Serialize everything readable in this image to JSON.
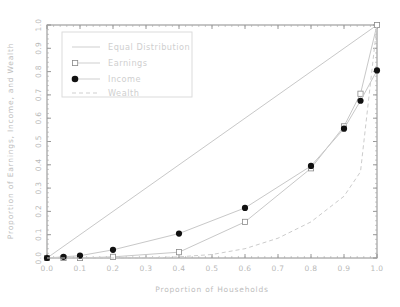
{
  "chart_data": {
    "type": "line",
    "title": "",
    "xlabel": "Proportion of Households",
    "ylabel": "Proportion of Earnings, Income, and Wealth",
    "xlim": [
      0.0,
      1.0
    ],
    "ylim": [
      0.0,
      1.0
    ],
    "grid": false,
    "legend_position": "upper left",
    "xticks": [
      "0.0",
      "0.1",
      "0.2",
      "0.3",
      "0.4",
      "0.5",
      "0.6",
      "0.7",
      "0.8",
      "0.9",
      "1.0"
    ],
    "xtick_values": [
      0.0,
      0.1,
      0.2,
      0.3,
      0.4,
      0.5,
      0.6,
      0.7,
      0.8,
      0.9,
      1.0
    ],
    "yticks": [
      "0.0",
      "0.1",
      "0.2",
      "0.3",
      "0.4",
      "0.5",
      "0.6",
      "0.7",
      "0.8",
      "0.9",
      "1.0"
    ],
    "ytick_values": [
      0.0,
      0.1,
      0.2,
      0.3,
      0.4,
      0.5,
      0.6,
      0.7,
      0.8,
      0.9,
      1.0
    ],
    "series": [
      {
        "name": "Equal Distribution",
        "style": "solid",
        "marker": "none",
        "color": "#c8c8c8",
        "x": [
          0.0,
          1.0
        ],
        "values": [
          0.0,
          1.0
        ]
      },
      {
        "name": "Earnings",
        "style": "solid",
        "marker": "square",
        "color": "#c8c8c8",
        "marker_color": "#ffffff",
        "marker_edge": "#8a8a8a",
        "x": [
          0.0,
          0.05,
          0.1,
          0.2,
          0.4,
          0.6,
          0.8,
          0.9,
          0.95,
          1.0
        ],
        "values": [
          0.0,
          0.0,
          0.0,
          0.005,
          0.025,
          0.155,
          0.385,
          0.565,
          0.705,
          1.0
        ]
      },
      {
        "name": "Income",
        "style": "solid",
        "marker": "circle",
        "color": "#c8c8c8",
        "marker_color": "#111111",
        "x": [
          0.0,
          0.05,
          0.1,
          0.2,
          0.4,
          0.6,
          0.8,
          0.9,
          0.95,
          1.0
        ],
        "values": [
          0.0,
          0.005,
          0.01,
          0.035,
          0.105,
          0.215,
          0.395,
          0.555,
          0.675,
          0.805
        ]
      },
      {
        "name": "Wealth",
        "style": "dashed",
        "marker": "none",
        "color": "#cccccc",
        "x": [
          0.0,
          0.1,
          0.2,
          0.3,
          0.4,
          0.5,
          0.6,
          0.7,
          0.8,
          0.9,
          0.95,
          1.0
        ],
        "values": [
          0.0,
          0.0,
          0.0,
          0.0,
          0.005,
          0.015,
          0.04,
          0.085,
          0.155,
          0.265,
          0.37,
          1.0
        ]
      }
    ]
  },
  "legend": {
    "entries": [
      {
        "label": "Equal Distribution"
      },
      {
        "label": "Earnings"
      },
      {
        "label": "Income"
      },
      {
        "label": "Wealth"
      }
    ]
  },
  "axes": {
    "x_title": "Proportion of Households",
    "y_title": "Proportion of Earnings, Income, and Wealth"
  },
  "colors": {
    "line": "#c8c8c8",
    "marker_fill": "#111111",
    "frame": "#8c8c8c",
    "text": "#c2c2c2"
  }
}
